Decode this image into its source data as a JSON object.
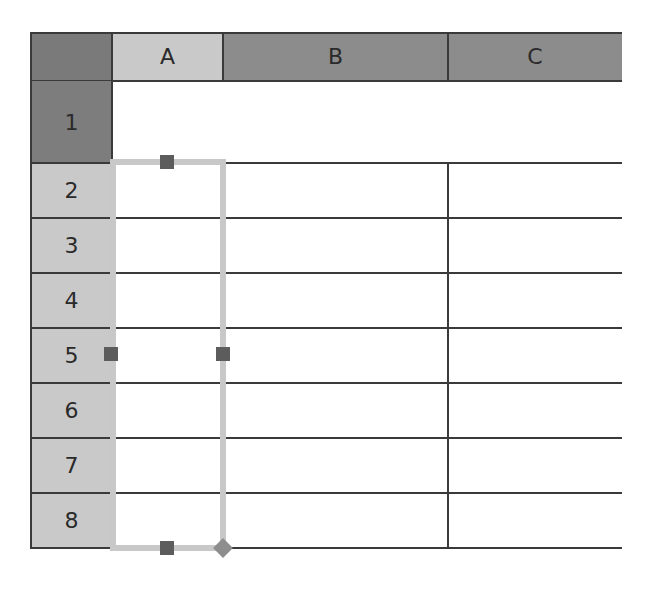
{
  "spreadsheet": {
    "columns": [
      {
        "label": "A",
        "selected": true
      },
      {
        "label": "B",
        "selected": false
      },
      {
        "label": "C",
        "selected": false
      }
    ],
    "rows": [
      {
        "label": "1",
        "selected": false
      },
      {
        "label": "2",
        "selected": true
      },
      {
        "label": "3",
        "selected": true
      },
      {
        "label": "4",
        "selected": true
      },
      {
        "label": "5",
        "selected": true
      },
      {
        "label": "6",
        "selected": true
      },
      {
        "label": "7",
        "selected": true
      },
      {
        "label": "8",
        "selected": true
      }
    ],
    "selection": {
      "range": "A2:A8",
      "handles": [
        "top-center",
        "middle-left",
        "middle-right",
        "bottom-center"
      ],
      "fill_handle": "bottom-right"
    },
    "colors": {
      "corner": "#7a7a7a",
      "column_header": "#8c8c8c",
      "selected_header": "#c9c9c9",
      "row1_header": "#7d7d7d",
      "grid_line": "#3a3a3a",
      "selection_border": "#c8c8c8",
      "handle": "#5c5c5c",
      "fill_handle": "#8e8e8e"
    }
  }
}
